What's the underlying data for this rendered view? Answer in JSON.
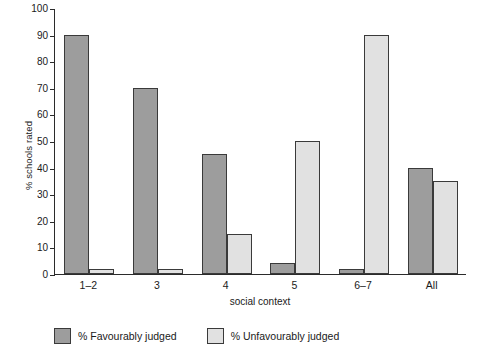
{
  "chart_data": {
    "type": "bar",
    "title": "",
    "xlabel": "social context",
    "ylabel": "% schools rated",
    "categories": [
      "1–2",
      "3",
      "4",
      "5",
      "6–7",
      "All"
    ],
    "series": [
      {
        "name": "% Favourably judged",
        "color": "#9d9d9d",
        "values": [
          90,
          70,
          45,
          4,
          2,
          40
        ]
      },
      {
        "name": "% Unfavourably judged",
        "color": "#e1e1e1",
        "values": [
          2,
          2,
          15,
          50,
          90,
          35
        ]
      }
    ],
    "ylim": [
      0,
      100
    ],
    "yticks": [
      0,
      10,
      20,
      30,
      40,
      50,
      60,
      70,
      80,
      90,
      100
    ],
    "ytick_labels": [
      "0",
      "10",
      "20",
      "30",
      "40",
      "50",
      "60",
      "70",
      "80",
      "90",
      "100"
    ],
    "grid": false,
    "legend_position": "bottom"
  },
  "legend": {
    "items": [
      {
        "label": "% Favourably judged",
        "swatch": "fav"
      },
      {
        "label": "% Unfavourably judged",
        "swatch": "unfav"
      }
    ]
  }
}
